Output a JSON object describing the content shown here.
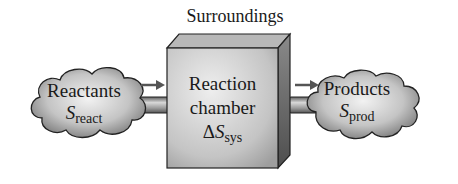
{
  "title": "Surroundings",
  "chamber": {
    "line1": "Reaction",
    "line2": "chamber",
    "delta": "Δ",
    "symbol": "S",
    "subscript": "sys"
  },
  "reactants": {
    "label": "Reactants",
    "symbol": "S",
    "subscript": "react"
  },
  "products": {
    "label": "Products",
    "symbol": "S",
    "subscript": "prod"
  },
  "arrows": [
    {
      "from": "reactants",
      "to": "chamber"
    },
    {
      "from": "chamber",
      "to": "products"
    }
  ],
  "colors": {
    "box_front": "#c8c8c8",
    "box_side": "#6e6e6e",
    "box_top": "#a8a8a8",
    "cloud": "#9a9a9a",
    "pipe": "#8c8c8c",
    "arrow": "#555555"
  }
}
